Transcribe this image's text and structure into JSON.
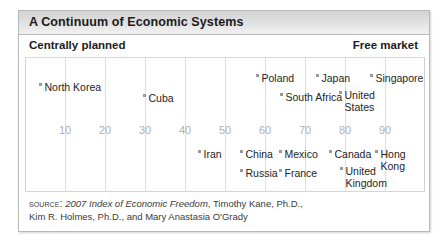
{
  "figure": {
    "title": "A Continuum of Economic Systems",
    "pole_left": "Centrally planned",
    "pole_right": "Free market"
  },
  "source": {
    "kicker": "Source:",
    "italic_title": "2007 Index of Economic Freedom",
    "rest": ", Timothy Kane, Ph.D.,",
    "line2": "Kim R. Holmes, Ph.D., and Mary Anastasia O'Grady"
  },
  "chart_data": {
    "type": "scatter",
    "title": "A Continuum of Economic Systems",
    "xlabel": "",
    "ylabel": "",
    "xlim": [
      0,
      100
    ],
    "grid": true,
    "legend": false,
    "axis_endpoint_labels": {
      "left": "Centrally planned",
      "right": "Free market"
    },
    "ticks": [
      10,
      20,
      30,
      40,
      50,
      60,
      70,
      80,
      90
    ],
    "tick_labels": [
      "10",
      "20",
      "30",
      "40",
      "50",
      "60",
      "70",
      "80",
      "90"
    ],
    "note": "Economic freedom score along a single horizontal axis; vertical placement is label layout only, not data.",
    "points": [
      {
        "label": "North Korea",
        "x": 3,
        "row": 1
      },
      {
        "label": "Cuba",
        "x": 29,
        "row": 1
      },
      {
        "label": "Poland",
        "x": 58,
        "row": 1
      },
      {
        "label": "Japan",
        "x": 73,
        "row": 1
      },
      {
        "label": "Singapore",
        "x": 88,
        "row": 1
      },
      {
        "label": "South Africa",
        "x": 64,
        "row": 2
      },
      {
        "label": "United States",
        "x": 80,
        "row": 2
      },
      {
        "label": "Iran",
        "x": 43,
        "row": 3
      },
      {
        "label": "China",
        "x": 53,
        "row": 3
      },
      {
        "label": "Mexico",
        "x": 63,
        "row": 3
      },
      {
        "label": "Canada",
        "x": 76,
        "row": 3
      },
      {
        "label": "Hong Kong",
        "x": 88,
        "row": 3
      },
      {
        "label": "Russia",
        "x": 53,
        "row": 4
      },
      {
        "label": "France",
        "x": 63,
        "row": 4
      },
      {
        "label": "United Kingdom",
        "x": 79,
        "row": 4
      }
    ]
  },
  "layout": {
    "gridlines_px": [
      0,
      40,
      80,
      120,
      160,
      200,
      240,
      280,
      320,
      360,
      399
    ],
    "tick_positions_px": [
      40,
      80,
      120,
      160,
      200,
      240,
      280,
      320,
      360
    ],
    "tick_y_px": 66,
    "countries": [
      {
        "name": "North Korea",
        "mx": 14,
        "my": 24,
        "wrap": false
      },
      {
        "name": "Cuba",
        "mx": 118,
        "my": 35,
        "wrap": false
      },
      {
        "name": "Poland",
        "mx": 231,
        "my": 15,
        "wrap": false
      },
      {
        "name": "Japan",
        "mx": 291,
        "my": 15,
        "wrap": false
      },
      {
        "name": "Singapore",
        "mx": 345,
        "my": 15,
        "wrap": false
      },
      {
        "name": "South Africa",
        "mx": 255,
        "my": 34,
        "wrap": false
      },
      {
        "name": "United\nStates",
        "mx": 314,
        "my": 32,
        "wrap": true
      },
      {
        "name": "Iran",
        "mx": 173,
        "my": 91,
        "wrap": false
      },
      {
        "name": "China",
        "mx": 215,
        "my": 91,
        "wrap": false
      },
      {
        "name": "Mexico",
        "mx": 254,
        "my": 91,
        "wrap": false
      },
      {
        "name": "Canada",
        "mx": 304,
        "my": 91,
        "wrap": false
      },
      {
        "name": "Hong\nKong",
        "mx": 350,
        "my": 91,
        "wrap": true
      },
      {
        "name": "Russia",
        "mx": 215,
        "my": 110,
        "wrap": false
      },
      {
        "name": "France",
        "mx": 254,
        "my": 110,
        "wrap": false
      },
      {
        "name": "United\nKingdom",
        "mx": 315,
        "my": 108,
        "wrap": true
      }
    ]
  }
}
